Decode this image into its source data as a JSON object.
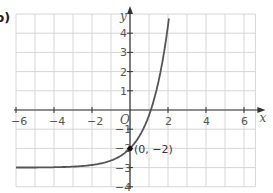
{
  "part_label": "b)",
  "chart_data": {
    "type": "line",
    "title": "",
    "xlabel": "x",
    "ylabel": "y",
    "origin_label": "O",
    "xlim": [
      -6,
      6.5
    ],
    "ylim": [
      -4,
      5
    ],
    "grid": true,
    "x_ticks": [
      -6,
      -4,
      -2,
      2,
      4,
      6
    ],
    "x_tick_labels": [
      "−6",
      "−4",
      "−2",
      "2",
      "4",
      "6"
    ],
    "y_ticks": [
      4,
      3,
      2,
      1,
      -1,
      -2,
      -3,
      -4
    ],
    "y_tick_labels": [
      "4",
      "3",
      "2",
      "1",
      "−1",
      "−2",
      "−3",
      "−4"
    ],
    "series": [
      {
        "name": "y = e^x − 3",
        "color": "#555555",
        "x": [
          -6,
          -5,
          -4,
          -3,
          -2,
          -1,
          0,
          0.5,
          1,
          1.1,
          1.5,
          1.8,
          2.08
        ],
        "y": [
          -2.998,
          -2.993,
          -2.98,
          -2.95,
          -2.86,
          -2.63,
          -2,
          -1.35,
          -0.28,
          0,
          1.48,
          3.05,
          5.0
        ]
      }
    ],
    "asymptote": {
      "y": -3
    },
    "annotations": [
      {
        "text": "(0, −2)",
        "x": 0,
        "y": -2,
        "marker": "point"
      }
    ]
  }
}
